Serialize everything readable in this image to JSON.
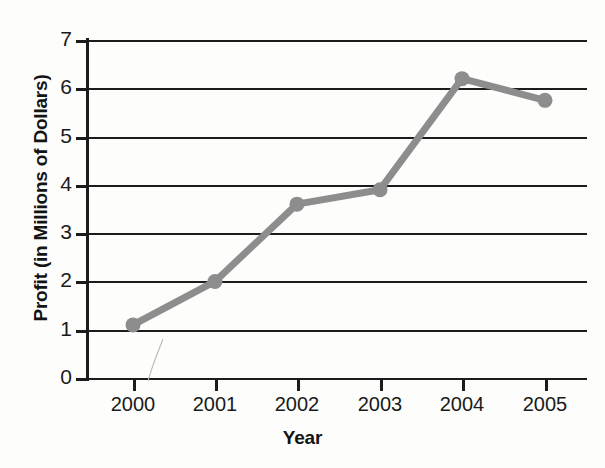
{
  "chart_data": {
    "type": "line",
    "title": "",
    "xlabel": "Year",
    "ylabel": "Profit (in Millions of Dollars)",
    "categories": [
      "2000",
      "2001",
      "2002",
      "2003",
      "2004",
      "2005"
    ],
    "values": [
      1.1,
      2.0,
      3.6,
      3.9,
      6.2,
      5.75
    ],
    "series": [
      {
        "name": "Profit",
        "values": [
          1.1,
          2.0,
          3.6,
          3.9,
          6.2,
          5.75
        ]
      }
    ],
    "ylim": [
      0,
      7
    ],
    "y_ticks": [
      "0",
      "1",
      "2",
      "3",
      "4",
      "5",
      "6",
      "7"
    ],
    "x_ticks": [
      "2000",
      "2001",
      "2002",
      "2003",
      "2004",
      "2005"
    ],
    "grid": "horizontal",
    "legend": "none",
    "line_color": "#8d8d8d",
    "marker_color": "#8d8d8d",
    "axis_color": "#1c1c1c",
    "background_color": "#fdfdfc"
  },
  "axes": {
    "y_title": "Profit (in Millions of Dollars)",
    "x_title": "Year"
  }
}
